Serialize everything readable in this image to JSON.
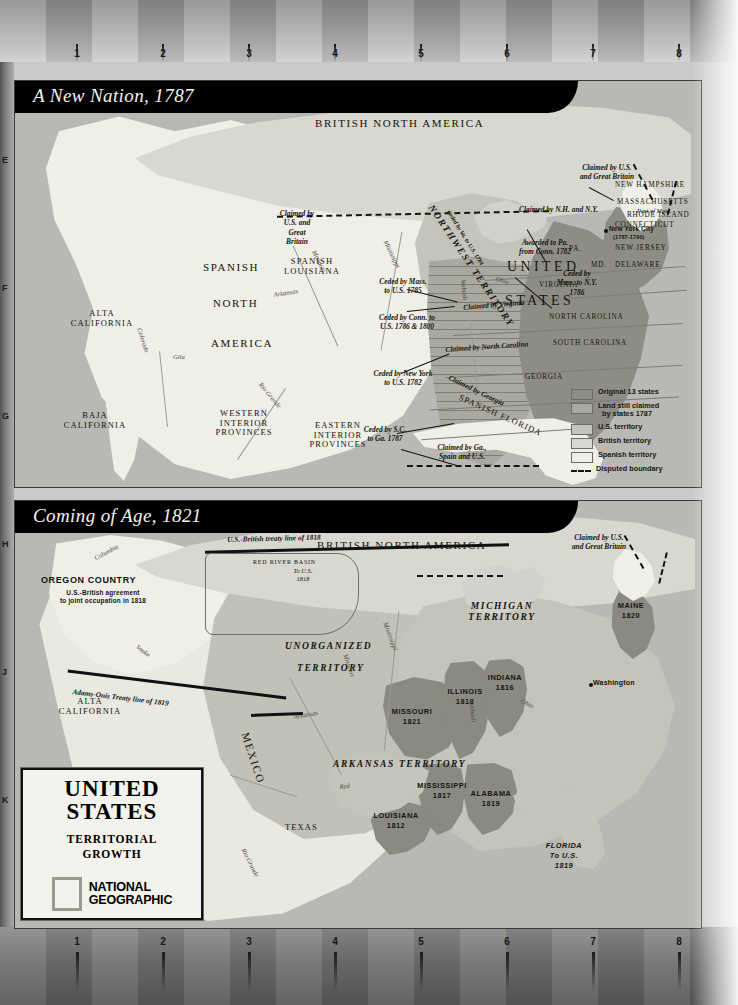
{
  "document": {
    "publisher": "NATIONAL GEOGRAPHIC",
    "title_line1": "UNITED",
    "title_line2": "STATES",
    "subtitle_line1": "TERRITORIAL",
    "subtitle_line2": "GROWTH"
  },
  "grid": {
    "columns": [
      "1",
      "2",
      "3",
      "4",
      "5",
      "6",
      "7",
      "8"
    ],
    "rows": [
      "E",
      "F",
      "G",
      "H",
      "J",
      "K"
    ]
  },
  "maps": [
    {
      "id": "map-a-new-nation-1787",
      "title": "A New Nation, 1787",
      "regions": [
        {
          "name": "BRITISH NORTH AMERICA",
          "style": "cap-large"
        },
        {
          "name": "NORTHWEST TERRITORY",
          "style": "territory"
        },
        {
          "name": "UNITED",
          "style": "cap-big"
        },
        {
          "name": "STATES",
          "style": "cap-big"
        },
        {
          "name": "SPANISH",
          "style": "cap"
        },
        {
          "name": "NORTH",
          "style": "cap"
        },
        {
          "name": "AMERICA",
          "style": "cap"
        },
        {
          "name": "SPANISH LOUISIANA",
          "style": "cap-sm"
        },
        {
          "name": "SPANISH FLORIDA",
          "style": "cap-sm"
        },
        {
          "name": "ALTA CALIFORNIA",
          "style": "cap-sm"
        },
        {
          "name": "BAJA CALIFORNIA",
          "style": "cap-sm"
        },
        {
          "name": "WESTERN INTERIOR PROVINCES",
          "style": "cap-sm"
        },
        {
          "name": "EASTERN INTERIOR PROVINCES",
          "style": "cap-sm"
        }
      ],
      "states": [
        "NEW HAMPSHIRE",
        "MASSACHUSETTS",
        "RHODE ISLAND",
        "CONNECTICUT",
        "NEW JERSEY",
        "DELAWARE",
        "PA.",
        "MD.",
        "VIRGINIA",
        "NORTH CAROLINA",
        "SOUTH CAROLINA",
        "GEORGIA"
      ],
      "cities": [
        {
          "name": "New York City",
          "note": "(1787-1790)"
        }
      ],
      "annotations": [
        "Claimed by U.S. and Great Britain",
        "Claimed by N.H. and N.Y.",
        "Part of Mass.",
        "Awarded to Pa. from Conn. 1782",
        "Ceded by Mass. to N.Y. 1786",
        "Claimed by U.S. and Great Britain",
        "Ceded by Mass. to U.S. 1785",
        "Ceded by Conn. to U.S. 1786 & 1800",
        "Ceded by New York to U.S. 1782",
        "Ceded by Va. to U.S. 1784",
        "Claimed by Virginia",
        "Claimed by North Carolina",
        "Claimed by Georgia",
        "Ceded by S.C. to Ga. 1787",
        "Claimed by Ga., Spain and U.S."
      ],
      "rivers": [
        "Mississippi",
        "Missouri",
        "Arkansas",
        "Ohio",
        "Wabash",
        "Colorado",
        "Gila",
        "Rio Grande"
      ],
      "legend": {
        "items": [
          {
            "label": "Original 13 states",
            "color": "#8e8d85"
          },
          {
            "label": "Land still claimed by states 1787",
            "color": "#a9a9a0"
          },
          {
            "label": "U.S. territory",
            "color": "#c5c4bb"
          },
          {
            "label": "British territory",
            "color": "#d9d8d0"
          },
          {
            "label": "Spanish territory",
            "color": "#efeee7"
          },
          {
            "label": "Disputed boundary",
            "color": "dashed"
          }
        ]
      }
    },
    {
      "id": "map-coming-of-age-1821",
      "title": "Coming of Age, 1821",
      "regions": [
        {
          "name": "BRITISH NORTH AMERICA",
          "style": "cap-large"
        },
        {
          "name": "OREGON COUNTRY",
          "style": "sans"
        },
        {
          "name": "UNORGANIZED",
          "style": "territory"
        },
        {
          "name": "TERRITORY",
          "style": "territory"
        },
        {
          "name": "MICHIGAN TERRITORY",
          "style": "territory"
        },
        {
          "name": "ARKANSAS TERRITORY",
          "style": "territory"
        },
        {
          "name": "MEXICO",
          "style": "cap"
        },
        {
          "name": "TEXAS",
          "style": "cap-sm"
        },
        {
          "name": "ALTA CALIFORNIA",
          "style": "cap-sm"
        },
        {
          "name": "RED RIVER BASIN",
          "style": "cap-xs"
        }
      ],
      "states": [
        {
          "name": "MAINE",
          "year": "1820"
        },
        {
          "name": "ILLINOIS",
          "year": "1818"
        },
        {
          "name": "INDIANA",
          "year": "1816"
        },
        {
          "name": "MISSOURI",
          "year": "1821"
        },
        {
          "name": "MISSISSIPPI",
          "year": "1817"
        },
        {
          "name": "ALABAMA",
          "year": "1819"
        },
        {
          "name": "LOUISIANA",
          "year": "1812"
        }
      ],
      "cities": [
        {
          "name": "Washington",
          "note": ""
        }
      ],
      "annotations": [
        "U.S.-British treaty line of 1818",
        "Adams-Onis Treaty line of 1819",
        "U.S.-British agreement to joint occupation in 1818",
        "Claimed by U.S. and Great Britain",
        "To U.S. 1818",
        "FLORIDA To U.S. 1819"
      ],
      "rivers": [
        "Columbia",
        "Snake",
        "Mississippi",
        "Missouri",
        "Arkansas",
        "Red",
        "Ohio",
        "Wabash",
        "Rio Grande"
      ]
    }
  ],
  "colors": {
    "original_13": "#8e8d85",
    "claimed_by_states": "#a9a9a0",
    "us_territory": "#c5c4bb",
    "british_territory": "#d9d8d0",
    "spanish_territory": "#efeee7",
    "water": "#b8b8b4",
    "title_bar": "#000000"
  }
}
